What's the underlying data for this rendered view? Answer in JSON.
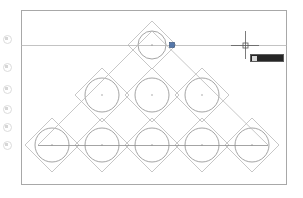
{
  "app": {
    "title": "CAD Drawing Editor",
    "canvas_background": "#ffffff"
  },
  "colors": {
    "border": "#a8a8a8",
    "diamond": "#b9b9b9",
    "circle": "#8d8d8d",
    "construction_line": "#b4b4b4",
    "base_line": "#8d8d8d",
    "crosshair": "#5a5a5a",
    "grip": "#5577aa",
    "tooltip_background": "#262626",
    "tooltip_text": "#cfcfcf"
  },
  "toolbar": {
    "name": "left-toolbar",
    "icons": [
      {
        "name": "draw-tool-icon",
        "y": 34
      },
      {
        "name": "circle-tool-icon",
        "y": 62
      },
      {
        "name": "arc-tool-icon",
        "y": 84
      },
      {
        "name": "polygon-tool-icon",
        "y": 104
      },
      {
        "name": "rectangle-tool-icon",
        "y": 122
      },
      {
        "name": "hatch-tool-icon",
        "y": 140
      }
    ]
  },
  "drawing": {
    "border": {
      "x": 21,
      "y": 10,
      "width": 266,
      "height": 175
    },
    "cell": 50,
    "circle_radius": 17,
    "top_circle_radius": 14,
    "rows": [
      {
        "row": 0,
        "count": 1,
        "cy": 45,
        "radius": 14,
        "half": 24,
        "centers": [
          152
        ]
      },
      {
        "row": 1,
        "count": 3,
        "cy": 95,
        "radius": 17,
        "half": 27,
        "centers": [
          102,
          152,
          202
        ]
      },
      {
        "row": 2,
        "count": 5,
        "cy": 145,
        "radius": 17,
        "half": 27,
        "centers": [
          52,
          102,
          152,
          202,
          252
        ]
      }
    ],
    "construction_line": {
      "x1": 21,
      "x2": 287,
      "y": 45
    },
    "base_line": {
      "x1": 38,
      "x2": 268,
      "y": 145
    },
    "apex_lines": [
      {
        "x1": 38,
        "y1": 145,
        "x2": 152,
        "y2": 31
      },
      {
        "x1": 268,
        "y1": 145,
        "x2": 152,
        "y2": 31
      }
    ]
  },
  "cursor": {
    "name": "crosshair-cursor",
    "x": 245,
    "y": 45,
    "arm_length": 14,
    "pick_box": 5
  },
  "grip": {
    "name": "selection-grip",
    "x": 172,
    "y": 45,
    "size": 5
  },
  "dynamic_input": {
    "label": "",
    "value": "",
    "visible": true
  }
}
